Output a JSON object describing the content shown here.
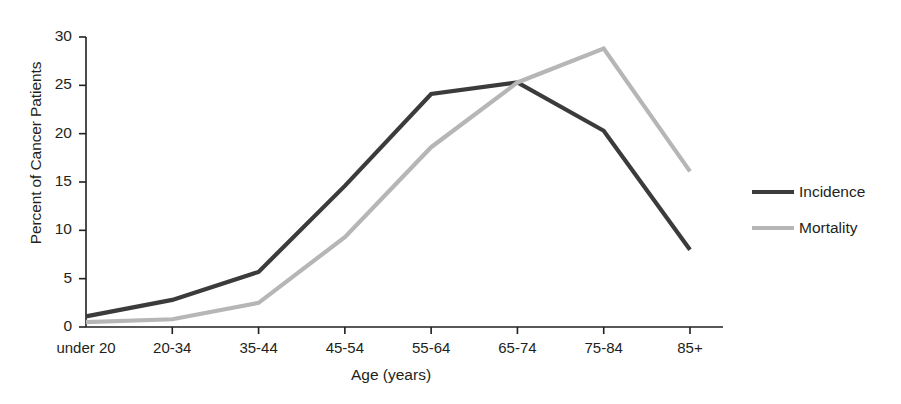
{
  "chart_data": {
    "type": "line",
    "title": "",
    "xlabel": "Age (years)",
    "ylabel": "Percent of Cancer Patients",
    "categories": [
      "under 20",
      "20-34",
      "35-44",
      "45-54",
      "55-64",
      "65-74",
      "75-84",
      "85+"
    ],
    "ylim": [
      0,
      30
    ],
    "yticks": [
      0,
      5,
      10,
      15,
      20,
      25,
      30
    ],
    "ytick_labels": [
      "0",
      "5",
      "10",
      "15",
      "20",
      "25",
      "30"
    ],
    "grid": false,
    "legend_position": "right",
    "series": [
      {
        "name": "Incidence",
        "color": "#3b3b3b",
        "values": [
          1.1,
          2.8,
          5.7,
          14.6,
          24.1,
          25.3,
          20.3,
          8.0
        ]
      },
      {
        "name": "Mortality",
        "color": "#b6b6b6",
        "values": [
          0.5,
          0.8,
          2.5,
          9.3,
          18.6,
          25.3,
          28.8,
          16.1
        ]
      }
    ]
  },
  "legend": {
    "items": [
      {
        "label": "Incidence",
        "color": "#3b3b3b"
      },
      {
        "label": "Mortality",
        "color": "#b6b6b6"
      }
    ]
  }
}
